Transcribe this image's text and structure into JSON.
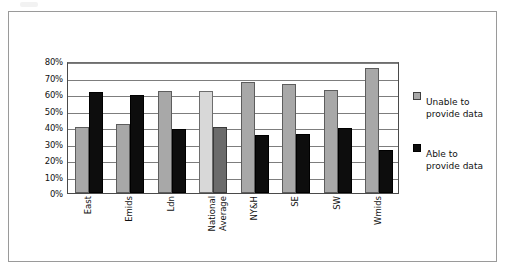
{
  "figure": {
    "frame_border_color": "#9a9a9a",
    "background": "#ffffff"
  },
  "chart_data": {
    "type": "bar",
    "title": "",
    "subtitle": "",
    "xlabel": "",
    "ylabel": "",
    "ylim": [
      0,
      80
    ],
    "ytick_step": 10,
    "grid": true,
    "grid_axis": "y",
    "legend_position": "right",
    "orientation": "vertical",
    "grouping": "grouped",
    "value_unit": "%",
    "categories": [
      "East",
      "Emids",
      "Ldn",
      "National Average",
      "NY&H",
      "SE",
      "SW",
      "Wmids"
    ],
    "category_lines": [
      [
        "East"
      ],
      [
        "Emids"
      ],
      [
        "Ldn"
      ],
      [
        "National",
        "Average"
      ],
      [
        "NY&H"
      ],
      [
        "SE"
      ],
      [
        "SW"
      ],
      [
        "Wmids"
      ]
    ],
    "ytick_labels": [
      "80%",
      "70%",
      "60%",
      "50%",
      "40%",
      "30%",
      "20%",
      "10%",
      "0%"
    ],
    "ytick_values": [
      80,
      70,
      60,
      50,
      40,
      30,
      20,
      10,
      0
    ],
    "series": [
      {
        "name": "Unable to provide data",
        "color": "#a8a8a8",
        "highlight_color": "#d8d8d8",
        "values": [
          40,
          42,
          62,
          62,
          67,
          66,
          62.5,
          76
        ]
      },
      {
        "name": "Able to provide data",
        "color": "#0d0d0d",
        "highlight_color": "#6b6b6b",
        "values": [
          61,
          59.5,
          39,
          40,
          35,
          36,
          39.5,
          26
        ]
      }
    ],
    "highlighted_category": "National Average",
    "legend": [
      {
        "label_line1": "Unable to",
        "label_line2": "provide data",
        "swatch": "#a8a8a8"
      },
      {
        "label_line1": "Able to",
        "label_line2": "provide data",
        "swatch": "#0d0d0d"
      }
    ]
  }
}
